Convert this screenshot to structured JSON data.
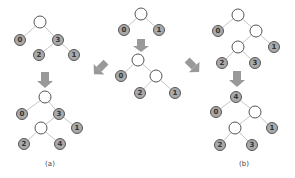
{
  "colors": {
    "leaf_fill": "#a9a9a9",
    "empty_fill": "#ffffff",
    "outline": "#555555",
    "edge": "#b8b8b8",
    "arrow": "#999999"
  },
  "captions": {
    "left": "(a)",
    "right": "(b)"
  },
  "trees": {
    "center_top": {
      "nodes": [
        {
          "id": "r",
          "x": 141,
          "y": 14,
          "label": ""
        },
        {
          "id": "a",
          "x": 124,
          "y": 30,
          "label": "0"
        },
        {
          "id": "b",
          "x": 159,
          "y": 30,
          "label": "1"
        }
      ]
    },
    "center_bottom": {
      "nodes": [
        {
          "id": "r",
          "x": 138,
          "y": 60,
          "label": ""
        },
        {
          "id": "a",
          "x": 121,
          "y": 76,
          "label": "0"
        },
        {
          "id": "i",
          "x": 156,
          "y": 76,
          "label": ""
        },
        {
          "id": "c",
          "x": 140,
          "y": 93,
          "label": "2"
        },
        {
          "id": "d",
          "x": 175,
          "y": 93,
          "label": "1"
        }
      ]
    },
    "left_top": {
      "nodes": [
        {
          "id": "r",
          "x": 40,
          "y": 22,
          "label": ""
        },
        {
          "id": "a",
          "x": 20,
          "y": 40,
          "label": "0"
        },
        {
          "id": "b",
          "x": 58,
          "y": 40,
          "label": "3"
        },
        {
          "id": "c",
          "x": 39,
          "y": 55,
          "label": "2"
        },
        {
          "id": "d",
          "x": 74,
          "y": 55,
          "label": "1"
        }
      ]
    },
    "left_bottom": {
      "nodes": [
        {
          "id": "r",
          "x": 45,
          "y": 97,
          "label": ""
        },
        {
          "id": "a",
          "x": 22,
          "y": 114,
          "label": "0"
        },
        {
          "id": "b",
          "x": 59,
          "y": 114,
          "label": "3"
        },
        {
          "id": "i",
          "x": 41,
          "y": 128,
          "label": ""
        },
        {
          "id": "d",
          "x": 77,
          "y": 128,
          "label": "1"
        },
        {
          "id": "e",
          "x": 24,
          "y": 144,
          "label": "2"
        },
        {
          "id": "f",
          "x": 60,
          "y": 144,
          "label": "4"
        }
      ]
    },
    "right_top": {
      "nodes": [
        {
          "id": "r",
          "x": 238,
          "y": 15,
          "label": ""
        },
        {
          "id": "a",
          "x": 218,
          "y": 31,
          "label": "0"
        },
        {
          "id": "i",
          "x": 256,
          "y": 31,
          "label": ""
        },
        {
          "id": "j",
          "x": 238,
          "y": 47,
          "label": ""
        },
        {
          "id": "d",
          "x": 274,
          "y": 47,
          "label": "1"
        },
        {
          "id": "e",
          "x": 222,
          "y": 63,
          "label": "2"
        },
        {
          "id": "f",
          "x": 255,
          "y": 63,
          "label": "3"
        }
      ]
    },
    "right_bottom": {
      "nodes": [
        {
          "id": "r",
          "x": 236,
          "y": 97,
          "label": "4"
        },
        {
          "id": "a",
          "x": 216,
          "y": 112,
          "label": "0"
        },
        {
          "id": "i",
          "x": 255,
          "y": 112,
          "label": ""
        },
        {
          "id": "j",
          "x": 235,
          "y": 128,
          "label": ""
        },
        {
          "id": "d",
          "x": 272,
          "y": 128,
          "label": "1"
        },
        {
          "id": "e",
          "x": 220,
          "y": 145,
          "label": "2"
        },
        {
          "id": "f",
          "x": 252,
          "y": 145,
          "label": "3"
        }
      ]
    }
  }
}
